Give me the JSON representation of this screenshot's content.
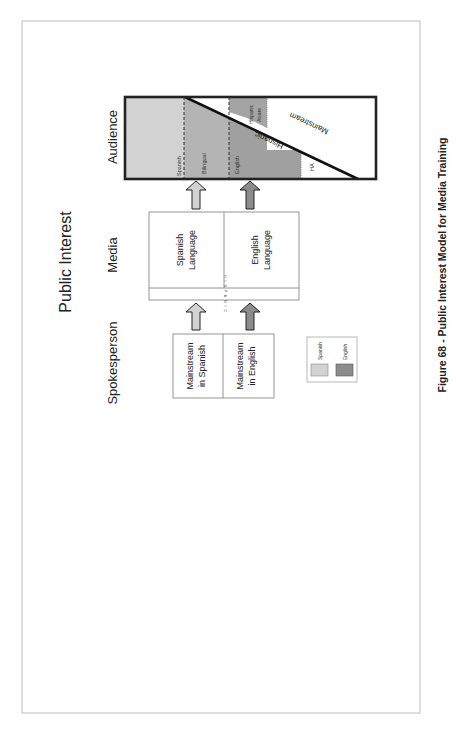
{
  "figure": {
    "title": "Public Interest",
    "caption": "Figure 68 - Public Interest Model for Media Training"
  },
  "columns": {
    "spokesperson": "Spokesperson",
    "media": "Media",
    "audience": "Audience"
  },
  "spokesperson": {
    "boxes": [
      {
        "label_line1": "Mainstream",
        "label_line2": "in Spanish",
        "language": "Spanish"
      },
      {
        "label_line1": "Mainstream",
        "label_line2": "in English",
        "language": "English"
      }
    ]
  },
  "media": {
    "strip_label": "H I S P A N I C",
    "boxes": [
      {
        "label_line1": "Spanish",
        "label_line2": "Language",
        "language": "Spanish"
      },
      {
        "label_line1": "English",
        "label_line2": "Language",
        "language": "English"
      }
    ]
  },
  "audience": {
    "segments": {
      "spanish": "Spanish",
      "bilingual": "Bilingual",
      "english": "English",
      "hispanic_aware_line1": "Hispanic",
      "hispanic_aware_line2": "Aware",
      "ha": "HA"
    },
    "diagonal_labels": {
      "hispanic": "Hispanic",
      "mainstream": "Mainstream"
    }
  },
  "legend": {
    "items": [
      {
        "label": "Spanish",
        "color": "#d2d2d2"
      },
      {
        "label": "English",
        "color": "#8c8c8c"
      }
    ]
  },
  "colors": {
    "spanish_light": "#d2d2d2",
    "bilingual_mid": "#b4b4b4",
    "english_dark": "#a0a0a0",
    "english_arrow": "#8c8c8c",
    "frame": "#bdbdbd",
    "box_border": "#7a7a7a"
  }
}
